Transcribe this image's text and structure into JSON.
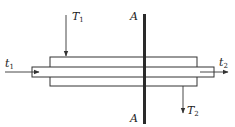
{
  "diagram": {
    "type": "double-pipe heat exchanger (countercurrent)",
    "labels": {
      "hot_inlet": {
        "main": "T",
        "sub": "1"
      },
      "hot_outlet": {
        "main": "T",
        "sub": "2"
      },
      "cold_inlet": {
        "main": "t",
        "sub": "1"
      },
      "cold_outlet": {
        "main": "t",
        "sub": "2"
      },
      "section_top": "A",
      "section_bottom": "A"
    },
    "colors": {
      "line": "#333333",
      "section_bar": "#2a2a2a",
      "background": "#ffffff"
    }
  }
}
